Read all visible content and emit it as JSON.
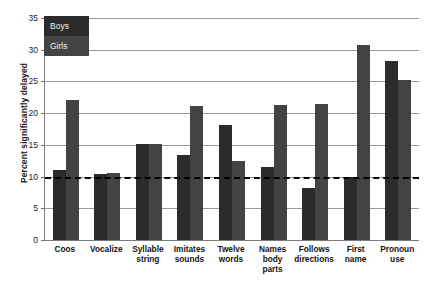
{
  "chart_data": {
    "type": "bar",
    "title": "",
    "xlabel": "",
    "ylabel": "Percent significantly delayed",
    "ylim": [
      0,
      35
    ],
    "ytick_values": [
      0,
      5,
      10,
      15,
      20,
      25,
      30,
      35
    ],
    "ytick_labels": [
      "0",
      "5",
      "10",
      "15",
      "20",
      "25",
      "30",
      "35"
    ],
    "grid": true,
    "legend_position": "top-left-inside",
    "categories": [
      "Coos",
      "Vocalize",
      "Syllable\nstring",
      "Imitates\nsounds",
      "Twelve\nwords",
      "Names\nbody\nparts",
      "Follows\ndirections",
      "First\nname",
      "Pronoun\nuse"
    ],
    "series": [
      {
        "name": "Boys",
        "color": "#2b2b2b",
        "values": [
          11.1,
          10.4,
          15.2,
          13.4,
          18.2,
          11.5,
          8.2,
          10.0,
          28.2
        ]
      },
      {
        "name": "Girls",
        "color": "#434343",
        "values": [
          22.0,
          10.6,
          15.2,
          21.2,
          12.4,
          21.3,
          21.4,
          30.7,
          25.2
        ]
      }
    ],
    "annotations": [
      {
        "type": "reference-line",
        "orientation": "horizontal",
        "value": 10,
        "style": "dashed",
        "color": "#000000"
      }
    ]
  },
  "legend": {
    "items": [
      {
        "label": "Boys"
      },
      {
        "label": "Girls"
      }
    ]
  }
}
